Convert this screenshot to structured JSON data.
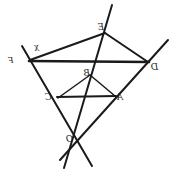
{
  "figure": {
    "background_color": "#ffffff",
    "stroke_color": "#1a1a1a",
    "width": 176,
    "height": 171,
    "mirrored_text": true,
    "labels": [
      {
        "id": "label-F",
        "text": "F",
        "x": 8,
        "y": 56,
        "size": "small"
      },
      {
        "id": "label-X",
        "text": "X",
        "x": 34,
        "y": 44,
        "size": "small"
      },
      {
        "id": "label-E",
        "text": "E",
        "x": 98,
        "y": 22,
        "size": "normal"
      },
      {
        "id": "label-D",
        "text": "D",
        "x": 151,
        "y": 62,
        "size": "normal"
      },
      {
        "id": "label-B",
        "text": "B",
        "x": 84,
        "y": 68,
        "size": "normal"
      },
      {
        "id": "label-C",
        "text": "C",
        "x": 45,
        "y": 92,
        "size": "normal"
      },
      {
        "id": "label-A",
        "text": "A",
        "x": 117,
        "y": 92,
        "size": "normal"
      },
      {
        "id": "label-O",
        "text": "O",
        "x": 66,
        "y": 134,
        "size": "normal"
      }
    ],
    "points": {
      "F": {
        "x": 30,
        "y": 60
      },
      "E": {
        "x": 105,
        "y": 33
      },
      "D": {
        "x": 148,
        "y": 62
      },
      "C": {
        "x": 58,
        "y": 98
      },
      "B": {
        "x": 90,
        "y": 75
      },
      "A": {
        "x": 115,
        "y": 96
      },
      "O": {
        "x": 78,
        "y": 141
      }
    },
    "segments": [
      {
        "id": "seg-FE",
        "from": "F",
        "to": "E",
        "weight": "med"
      },
      {
        "id": "seg-ED",
        "from": "E",
        "to": "D",
        "weight": "med"
      },
      {
        "id": "seg-FD",
        "from": "F",
        "to": "D",
        "weight": "thick"
      },
      {
        "id": "seg-CB",
        "from": "C",
        "to": "B",
        "weight": "thin"
      },
      {
        "id": "seg-BA",
        "from": "B",
        "to": "A",
        "weight": "thin"
      },
      {
        "id": "seg-CA",
        "from": "C",
        "to": "A",
        "weight": "med"
      }
    ],
    "rays": [
      {
        "id": "ray-O-F",
        "through": "F",
        "note": "O through F extended past both ends"
      },
      {
        "id": "ray-O-E",
        "through": "E",
        "note": "O through B and E extended"
      },
      {
        "id": "ray-O-D",
        "through": "D",
        "note": "O through A and D extended"
      }
    ],
    "concurrency_point": "O",
    "caption": ""
  }
}
